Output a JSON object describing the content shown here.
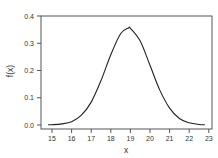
{
  "chart_data": {
    "type": "line",
    "title": "",
    "xlabel": "x",
    "ylabel": "f(x)",
    "xlim": [
      14.8,
      23.1
    ],
    "ylim": [
      0.0,
      0.4
    ],
    "grid": false,
    "legend": null,
    "x_ticks": [
      "15",
      "16",
      "17",
      "18",
      "19",
      "20",
      "21",
      "22",
      "23"
    ],
    "y_ticks": [
      "0.0",
      "0.1",
      "0.2",
      "0.3",
      "0.4"
    ],
    "series": [
      {
        "name": "f(x)",
        "color": "#222222",
        "x": [
          14.8,
          15.0,
          15.5,
          16.0,
          16.5,
          17.0,
          17.5,
          18.0,
          18.5,
          18.9,
          19.0,
          19.5,
          20.0,
          20.5,
          21.0,
          21.5,
          22.0,
          22.5,
          22.8
        ],
        "y": [
          0.001,
          0.001,
          0.004,
          0.012,
          0.036,
          0.084,
          0.163,
          0.258,
          0.335,
          0.356,
          0.355,
          0.308,
          0.219,
          0.128,
          0.062,
          0.024,
          0.008,
          0.002,
          0.001
        ]
      }
    ]
  }
}
